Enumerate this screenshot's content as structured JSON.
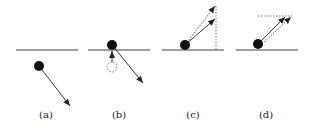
{
  "diagram": {
    "panels": [
      {
        "label": "(a)",
        "description": "ball below surface moving down-right"
      },
      {
        "label": "(b)",
        "description": "ball moved onto surface from dotted previous position, velocity down-right"
      },
      {
        "label": "(c)",
        "description": "velocity reflected upward, dotted vertical projection"
      },
      {
        "label": "(d)",
        "description": "velocity reflected upward, dotted horizontal projection"
      }
    ],
    "colors": {
      "stroke": "#333333",
      "ball": "#111111",
      "background": "#ffffff"
    }
  }
}
